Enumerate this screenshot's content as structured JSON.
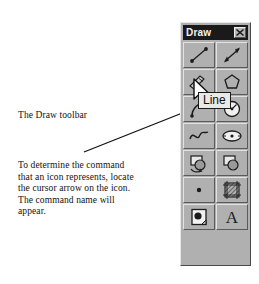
{
  "figure": {
    "caption_1": "The Draw toolbar",
    "caption_2": "To determine the command\nthat an icon represents, locate\nthe cursor arrow on the icon.\nThe command name will\nappear.",
    "leader_line": "leader-line"
  },
  "toolbar": {
    "title": "Draw",
    "close_label": "Close",
    "close_icon": "close-x-icon",
    "tooltip": "Line",
    "cursor": "cursor-arrow",
    "tools": [
      {
        "name": "line",
        "icon": "line-icon"
      },
      {
        "name": "construction-line",
        "icon": "construction-line-icon"
      },
      {
        "name": "polyline",
        "icon": "polyline-icon"
      },
      {
        "name": "polygon",
        "icon": "polygon-icon"
      },
      {
        "name": "arc",
        "icon": "arc-icon"
      },
      {
        "name": "circle",
        "icon": "circle-icon"
      },
      {
        "name": "spline",
        "icon": "spline-icon"
      },
      {
        "name": "ellipse",
        "icon": "ellipse-icon"
      },
      {
        "name": "insert-block",
        "icon": "insert-block-icon"
      },
      {
        "name": "make-block",
        "icon": "make-block-icon"
      },
      {
        "name": "point",
        "icon": "point-icon"
      },
      {
        "name": "hatch",
        "icon": "hatch-icon"
      },
      {
        "name": "region",
        "icon": "region-icon"
      },
      {
        "name": "multiline-text",
        "icon": "text-a-icon",
        "glyph": "A"
      }
    ]
  },
  "colors": {
    "toolbar_face": "#b0b0b0",
    "titlebar": "#1a1a1a",
    "title_text": "#f2f2f2",
    "tooltip_bg": "#e9e9e6",
    "ink": "#111111"
  }
}
